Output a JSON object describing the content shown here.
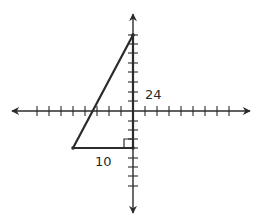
{
  "diagram": {
    "type": "coordinate-plane-right-triangle",
    "labels": {
      "vertical_leg": "24",
      "horizontal_leg": "10"
    },
    "colors": {
      "stroke": "#2b2b2b",
      "text": "#2a2a2a",
      "background": "#ffffff"
    },
    "axes": {
      "origin_px": [
        133,
        111
      ],
      "x_axis": {
        "from_px": 10,
        "to_px": 252,
        "arrows": "both"
      },
      "y_axis": {
        "from_px": 12,
        "to_px": 215,
        "arrows": "both"
      },
      "x_tick_px": [
        37,
        49,
        61,
        73,
        85,
        97,
        109,
        121,
        145,
        157,
        169,
        181,
        193,
        205,
        217,
        229
      ],
      "y_tick_px": [
        44,
        53,
        63,
        72,
        82,
        92,
        101,
        121,
        130,
        139,
        148,
        158,
        167,
        176,
        186
      ]
    },
    "triangle": {
      "vertices_px": {
        "top": [
          133,
          35
        ],
        "bottom_left": [
          73,
          148
        ],
        "right_angle": [
          133,
          148
        ]
      },
      "right_angle_marker_size_px": 9,
      "hypotenuse": "top to bottom_left",
      "vertical_leg": "right_angle to top, along y-axis",
      "horizontal_leg": "bottom_left to right_angle"
    }
  }
}
